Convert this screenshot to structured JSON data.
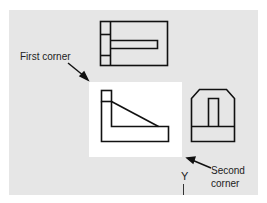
{
  "diagram": {
    "type": "orthographic-views-window-selection",
    "colors": {
      "panel_background": "#e6e6e6",
      "selection_window": "#ffffff",
      "line": "#111111",
      "text": "#222222"
    },
    "views": [
      {
        "name": "top-view"
      },
      {
        "name": "front-view",
        "selected": true
      },
      {
        "name": "right-side-view"
      }
    ],
    "labels": {
      "first_corner": "First corner",
      "second_corner_line1": "Second",
      "second_corner_line2": "corner",
      "y_axis": "Y"
    },
    "arrows": [
      {
        "from_label": "First corner",
        "points_to": "top-left of selection window"
      },
      {
        "from_label": "Second corner",
        "points_to": "bottom-right of selection window"
      }
    ]
  }
}
